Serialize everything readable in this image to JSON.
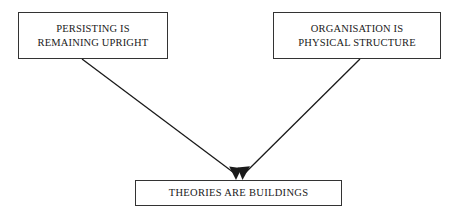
{
  "diagram": {
    "type": "conceptual-metaphor-mapping",
    "background_color": "#ffffff",
    "line_color": "#1a1a1a",
    "border_color": "#333333",
    "nodes": [
      {
        "id": "source-left",
        "label": "PERSISTING IS\nREMAINING UPRIGHT",
        "role": "source-mapping"
      },
      {
        "id": "source-right",
        "label": "ORGANISATION IS\nPHYSICAL STRUCTURE",
        "role": "source-mapping"
      },
      {
        "id": "target",
        "label": "THEORIES ARE BUILDINGS",
        "role": "target-metaphor"
      }
    ],
    "edges": [
      {
        "from": "source-left",
        "to": "target",
        "arrow": "single",
        "style": "solid"
      },
      {
        "from": "source-right",
        "to": "target",
        "arrow": "single",
        "style": "solid"
      }
    ]
  }
}
